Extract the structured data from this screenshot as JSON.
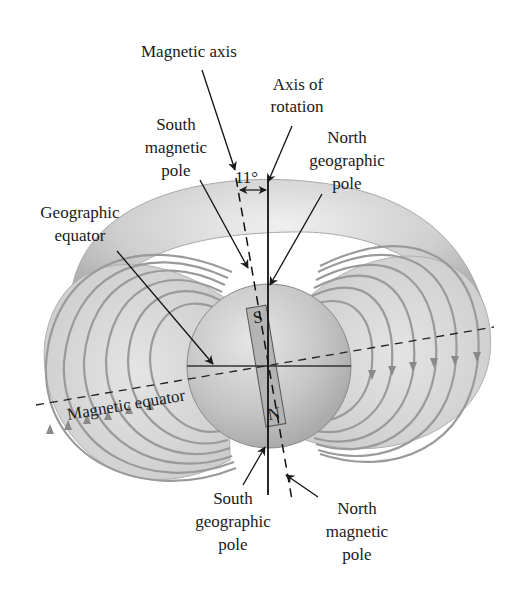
{
  "figure": {
    "angle_label": "11°",
    "labels": {
      "magnetic_axis": "Magnetic axis",
      "axis_of_rotation_1": "Axis of",
      "axis_of_rotation_2": "rotation",
      "south_magnetic_pole_1": "South",
      "south_magnetic_pole_2": "magnetic",
      "south_magnetic_pole_3": "pole",
      "north_geographic_pole_1": "North",
      "north_geographic_pole_2": "geographic",
      "north_geographic_pole_3": "pole",
      "geographic_equator_1": "Geographic",
      "geographic_equator_2": "equator",
      "magnetic_equator": "Magnetic equator",
      "south_geographic_pole_1": "South",
      "south_geographic_pole_2": "geographic",
      "south_geographic_pole_3": "pole",
      "north_magnetic_pole_1": "North",
      "north_magnetic_pole_2": "magnetic",
      "north_magnetic_pole_3": "pole"
    },
    "bar_magnet": {
      "top": "S",
      "bottom": "N"
    },
    "colors": {
      "field_lines": "#9a9a9a",
      "torus_light": "#e2e2e2",
      "torus_dark": "#a8a8a8",
      "sphere": "#c4c4c4",
      "ink": "#1a1a1a"
    }
  }
}
